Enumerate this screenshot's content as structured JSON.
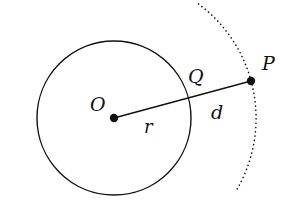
{
  "diagram": {
    "type": "geometry",
    "colors": {
      "stroke": "#111111",
      "background": "#ffffff"
    },
    "circle": {
      "center_label": "O",
      "cx": 114,
      "cy": 118,
      "r": 77
    },
    "arc": {
      "style": "dotted",
      "cx": 114,
      "cy": 118,
      "r": 142
    },
    "points": [
      {
        "id": "O",
        "label": "O",
        "x": 114,
        "y": 118
      },
      {
        "id": "P",
        "label": "P",
        "x": 251,
        "y": 81
      },
      {
        "id": "Q",
        "label": "Q",
        "x": 189,
        "y": 98
      }
    ],
    "segments": [
      {
        "from": "O",
        "to": "P"
      }
    ],
    "labels": {
      "O": "O",
      "P": "P",
      "Q": "Q",
      "r": "r",
      "d": "d"
    }
  }
}
